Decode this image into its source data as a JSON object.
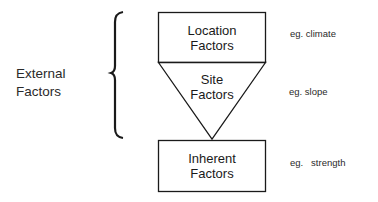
{
  "external": {
    "line1": "External",
    "line2": "Factors"
  },
  "boxes": {
    "location": {
      "line1": "Location",
      "line2": "Factors",
      "example": "eg. climate"
    },
    "site": {
      "line1": "Site",
      "line2": "Factors",
      "example": "eg. slope"
    },
    "inherent": {
      "line1": "Inherent",
      "line2": "Factors",
      "example": "eg.   strength"
    }
  },
  "colors": {
    "stroke": "#1a1a1a",
    "background": "#ffffff"
  }
}
